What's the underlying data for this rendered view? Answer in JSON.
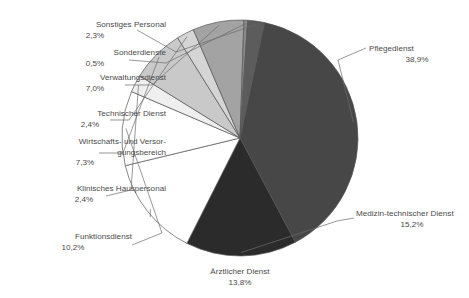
{
  "chart_data": {
    "type": "pie",
    "title": "",
    "subtitle": "",
    "xlabel": "",
    "ylabel": "",
    "legend_position": "none",
    "grid": false,
    "value_suffix": "%",
    "decimal_separator": ",",
    "start_angle_deg": 12,
    "direction": "clockwise",
    "categories": [
      "Pflegedienst",
      "Medizin-technischer Dienst",
      "Ärztlicher Dienst",
      "Funktionsdienst",
      "Klinisches Hauspersonal",
      "Wirtschafts- und Versorgungsbereich",
      "Technischer Dienst",
      "Verwaltungsdienst",
      "Sonderdienste",
      "Sonstiges Personal"
    ],
    "values": [
      38.9,
      15.2,
      13.8,
      10.2,
      2.4,
      7.3,
      2.4,
      7.0,
      0.5,
      2.3
    ],
    "colors": [
      "#474747",
      "#2b2b2b",
      "#ffffff",
      "#ffffff",
      "#efefef",
      "#c9c9c9",
      "#d5d5d5",
      "#a3a3a3",
      "#8a8a8a",
      "#5c5c5c"
    ],
    "slices": [
      {
        "name": "Pflegedienst",
        "value": 38.9,
        "value_label": "38,9%",
        "color": "#474747",
        "label_side": "right"
      },
      {
        "name": "Medizin-technischer Dienst",
        "value": 15.2,
        "value_label": "15,2%",
        "color": "#2b2b2b",
        "label_side": "right"
      },
      {
        "name": "Ärztlicher Dienst",
        "value": 13.8,
        "value_label": "13,8%",
        "color": "#ffffff",
        "label_side": "bottom"
      },
      {
        "name": "Funktionsdienst",
        "value": 10.2,
        "value_label": "10,2%",
        "color": "#ffffff",
        "label_side": "left"
      },
      {
        "name": "Klinisches Hauspersonal",
        "value": 2.4,
        "value_label": "2,4%",
        "color": "#efefef",
        "label_side": "left"
      },
      {
        "name": "Wirtschafts- und Versorgungsbereich",
        "name_line1": "Wirtschafts- und Versor-",
        "name_line2": "gungsbereich",
        "value": 7.3,
        "value_label": "7,3%",
        "color": "#c9c9c9",
        "label_side": "left"
      },
      {
        "name": "Technischer Dienst",
        "value": 2.4,
        "value_label": "2,4%",
        "color": "#d5d5d5",
        "label_side": "left"
      },
      {
        "name": "Verwaltungsdienst",
        "value": 7.0,
        "value_label": "7,0%",
        "color": "#a3a3a3",
        "label_side": "left"
      },
      {
        "name": "Sonderdienste",
        "value": 0.5,
        "value_label": "0,5%",
        "color": "#8a8a8a",
        "label_side": "left"
      },
      {
        "name": "Sonstiges Personal",
        "value": 2.3,
        "value_label": "2,3%",
        "color": "#5c5c5c",
        "label_side": "left"
      }
    ],
    "total": 100.0
  },
  "labels": {
    "sonstiges_personal": {
      "name": "Sonstiges Personal",
      "pct": "2,3%"
    },
    "sonderdienste": {
      "name": "Sonderdienste",
      "pct": "0,5%"
    },
    "verwaltungsdienst": {
      "name": "Verwaltungsdienst",
      "pct": "7,0%"
    },
    "technischer_dienst": {
      "name": "Technischer Dienst",
      "pct": "2,4%"
    },
    "wirtschafts": {
      "name_line1": "Wirtschafts- und Versor-",
      "name_line2": "gungsbereich",
      "pct": "7,3%"
    },
    "klinisches_hauspersonal": {
      "name": "Klinisches Hauspersonal",
      "pct": "2,4%"
    },
    "funktionsdienst": {
      "name": "Funktionsdienst",
      "pct": "10,2%"
    },
    "aerztlicher_dienst": {
      "name": "Ärztlicher Dienst",
      "pct": "13,8%"
    },
    "pflegedienst": {
      "name": "Pflegedienst",
      "pct": "38,9%"
    },
    "medizin_technischer_dienst": {
      "name": "Medizin-technischer Dienst",
      "pct": "15,2%"
    }
  },
  "style": {
    "background": "#ffffff",
    "text_color": "#4a4a4a",
    "slice_stroke": "#555555",
    "leader_color": "#6b6b6b"
  },
  "geometry": {
    "center_x": 240,
    "center_y": 138,
    "radius": 118
  }
}
